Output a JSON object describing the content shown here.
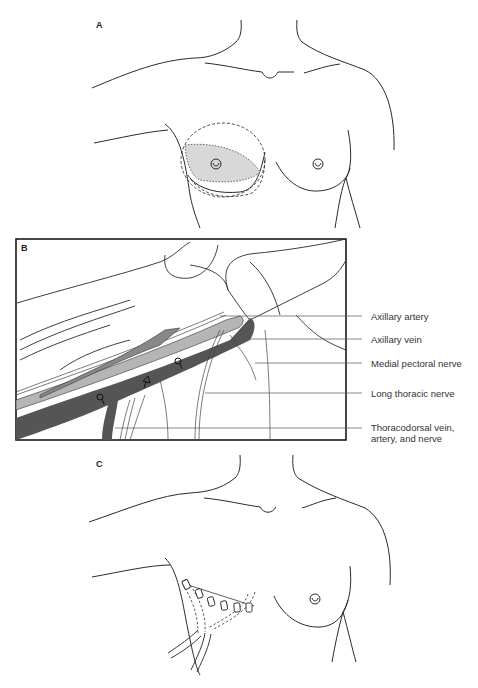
{
  "figure": {
    "panels": [
      {
        "id": "A",
        "letter": "A",
        "description": "Anterior chest outline with shaded breast region and dashed incision margins"
      },
      {
        "id": "B",
        "letter": "B",
        "description": "Axillary dissection view showing vessels and nerves"
      },
      {
        "id": "C",
        "letter": "C",
        "description": "Closed incision with skin clips and two drains"
      }
    ],
    "panel_b_labels": [
      {
        "text": "Axillary artery"
      },
      {
        "text": "Axillary vein"
      },
      {
        "text": "Medial pectoral nerve"
      },
      {
        "text": "Long thoracic nerve"
      },
      {
        "text": "Thoracodorsal vein, artery, and nerve"
      }
    ],
    "colors": {
      "line": "#2a2a2a",
      "shade_light": "#d8d8d8",
      "vessel_artery": "#b5b5b5",
      "vessel_vein": "#555555",
      "border": "#1a1a1a"
    }
  }
}
